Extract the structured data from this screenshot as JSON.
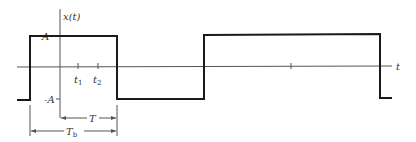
{
  "diagram": {
    "type": "waveform",
    "colors": {
      "signal": "#1a1a1a",
      "axis": "#555555",
      "text": "#333333",
      "background": "#ffffff"
    },
    "labels": {
      "y_axis": "x(t)",
      "x_axis": "t",
      "amp_pos": "A",
      "amp_neg": "-A",
      "t1": "t",
      "t1_sub": "1",
      "t2": "t",
      "t2_sub": "2",
      "period": "T",
      "bit_period": "T",
      "bit_period_sub": "b"
    },
    "waveform_levels": [
      "-A",
      "A",
      "-A",
      "A",
      "-A"
    ]
  }
}
